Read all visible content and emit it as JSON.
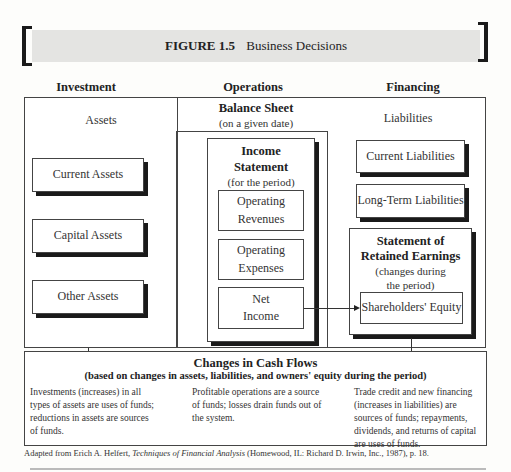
{
  "figure": {
    "number": "FIGURE 1.5",
    "title": "Business Decisions"
  },
  "columns": {
    "investment": "Investment",
    "operations": "Operations",
    "financing": "Financing"
  },
  "balance_sheet": {
    "title": "Balance Sheet",
    "subtitle": "(on a given date)",
    "assets_label": "Assets",
    "assets": [
      "Current Assets",
      "Capital Assets",
      "Other Assets"
    ],
    "liabilities_label": "Liabilities",
    "liabilities": [
      "Current Liabilities",
      "Long-Term Liabilities"
    ]
  },
  "income_statement": {
    "title_line1": "Income",
    "title_line2": "Statement",
    "subtitle": "(for the period)",
    "items": [
      {
        "line1": "Operating",
        "line2": "Revenues"
      },
      {
        "line1": "Operating",
        "line2": "Expenses"
      },
      {
        "line1": "Net",
        "line2": "Income"
      }
    ]
  },
  "retained_earnings": {
    "title_line1": "Statement of",
    "title_line2": "Retained Earnings",
    "subtitle_line1": "(changes during",
    "subtitle_line2": "the period)",
    "equity": "Shareholders' Equity"
  },
  "cash_flows": {
    "title": "Changes in Cash Flows",
    "subtitle": "(based on changes in assets, liabilities, and owners' equity during the period)",
    "investment_text": "Investments (increases) in all types of assets are uses of funds; reductions in assets are sources of funds.",
    "operations_text": "Profitable operations are a source of funds; losses drain funds out of the system.",
    "financing_text": "Trade credit and new financing (increases in liabilities) are sources of funds; repayments, dividends, and returns of capital are uses of funds."
  },
  "footnote": {
    "prefix": "Adapted from Erich A. Helfert, ",
    "book": "Techniques of Financial Analysis",
    "suffix": " (Homewood, IL: Richard D. Irwin, Inc., 1987), p. 18."
  }
}
